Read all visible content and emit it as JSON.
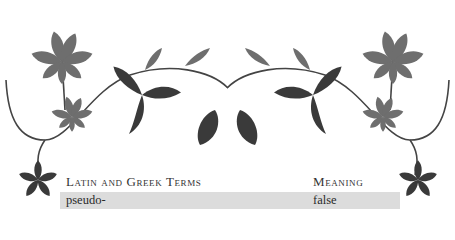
{
  "ornament": {
    "description": "decorative horse-chestnut leaf vine border",
    "colors": {
      "light_leaf": "#6e6e6e",
      "dark_leaf": "#3a3a3a",
      "vine": "#444444"
    }
  },
  "table": {
    "headers": [
      "Latin and Greek Terms",
      "Meaning"
    ],
    "rows": [
      {
        "term": "pseudo-",
        "meaning": "false",
        "shaded": true
      },
      {
        "term": "psychrophilus (psychrophila, psychrophilum)",
        "meaning": "cold-loving",
        "shaded": false
      }
    ],
    "shade_color": "#dcdcdc"
  }
}
